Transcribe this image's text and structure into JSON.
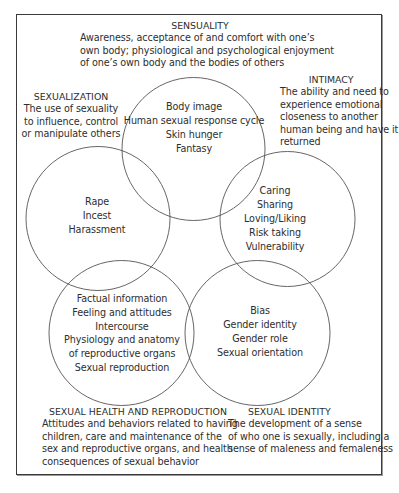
{
  "diagram": {
    "colors": {
      "frame": "#3a3a3a",
      "circle_stroke": "#555555",
      "text": "#2e2e2e",
      "background": "#ffffff"
    },
    "sensuality": {
      "title": "SENSUALITY",
      "lines": [
        "Awareness, acceptance of and comfort with one’s",
        "own body; physiological and psychological enjoyment",
        "of one’s own body and the bodies of others"
      ],
      "circle_items": [
        "Body image",
        "Human sexual response cycle",
        "Skin hunger",
        "Fantasy"
      ]
    },
    "sexualization": {
      "title": "SEXUALIZATION",
      "lines": [
        "The use of sexuality",
        "to influence, control",
        "or manipulate others"
      ],
      "circle_items": [
        "Rape",
        "Incest",
        "Harassment"
      ]
    },
    "intimacy": {
      "title": "INTIMACY",
      "lines": [
        "The ability and need to",
        "experience emotional",
        "closeness to another",
        "human being and have it",
        "returned"
      ],
      "circle_items": [
        "Caring",
        "Sharing",
        "Loving/Liking",
        "Risk taking",
        "Vulnerability"
      ]
    },
    "sexual_health": {
      "title": "SEXUAL HEALTH AND REPRODUCTION",
      "lines": [
        "Attitudes and behaviors related to having",
        "children, care and maintenance of the",
        "sex and reproductive organs, and health",
        "consequences of sexual behavior"
      ],
      "circle_items": [
        "Factual information",
        "Feeling and attitudes",
        "Intercourse",
        "Physiology and anatomy",
        "of reproductive organs",
        "Sexual reproduction"
      ]
    },
    "sexual_identity": {
      "title": "SEXUAL IDENTITY",
      "lines": [
        "The development of a sense",
        "of who one is sexually, including a",
        "sense of maleness and femaleness"
      ],
      "circle_items": [
        "Bias",
        "Gender identity",
        "Gender role",
        "Sexual orientation"
      ]
    }
  }
}
